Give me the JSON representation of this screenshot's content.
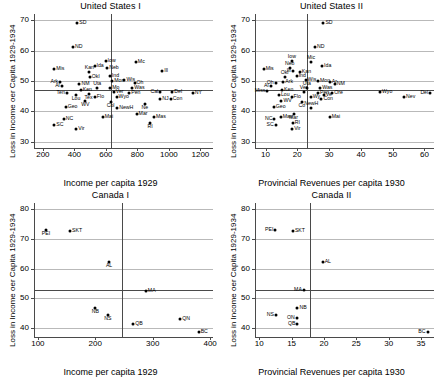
{
  "figure": {
    "width": 442,
    "height": 378
  },
  "chart_data": [
    {
      "type": "scatter",
      "title": "United States I",
      "xlabel": "Income per capita 1929",
      "ylabel": "Loss in Income oer Capita 1929-1934",
      "xlim": [
        150,
        1280
      ],
      "ylim": [
        28,
        72
      ],
      "xticks": [
        200,
        400,
        600,
        800,
        1000,
        1200
      ],
      "yticks": [
        30,
        40,
        50,
        60,
        70
      ],
      "grid": true,
      "vline": 635,
      "hline": 47,
      "points": [
        {
          "label": "SD",
          "x": 418,
          "y": 69.2,
          "pos": "r"
        },
        {
          "label": "ND",
          "x": 392,
          "y": 61.3,
          "pos": "r"
        },
        {
          "label": "Mis",
          "x": 272,
          "y": 53.9,
          "pos": "r"
        },
        {
          "label": "Ark",
          "x": 310,
          "y": 49.6,
          "pos": "l"
        },
        {
          "label": "Al",
          "x": 320,
          "y": 48.3,
          "pos": "l"
        },
        {
          "label": "Ten",
          "x": 352,
          "y": 46.0,
          "pos": "l"
        },
        {
          "label": "Geo",
          "x": 345,
          "y": 41.5,
          "pos": "r"
        },
        {
          "label": "NC",
          "x": 333,
          "y": 37.6,
          "pos": "r"
        },
        {
          "label": "SC",
          "x": 272,
          "y": 35.6,
          "pos": "r"
        },
        {
          "label": "Vir",
          "x": 412,
          "y": 34.4,
          "pos": "r"
        },
        {
          "label": "Kan",
          "x": 495,
          "y": 53.1,
          "pos": "t"
        },
        {
          "label": "Ida",
          "x": 528,
          "y": 54.9,
          "pos": "r"
        },
        {
          "label": "Okl",
          "x": 498,
          "y": 51.3,
          "pos": "r"
        },
        {
          "label": "NM",
          "x": 432,
          "y": 48.9,
          "pos": "r"
        },
        {
          "label": "Ken",
          "x": 440,
          "y": 47.0,
          "pos": "r"
        },
        {
          "label": "Lou",
          "x": 410,
          "y": 45.3,
          "pos": "b"
        },
        {
          "label": "Tex",
          "x": 490,
          "y": 45.8,
          "pos": "b"
        },
        {
          "label": "Uta",
          "x": 545,
          "y": 47.6,
          "pos": "t"
        },
        {
          "label": "Flo",
          "x": 530,
          "y": 44.9,
          "pos": "r"
        },
        {
          "label": "WV",
          "x": 470,
          "y": 43.3,
          "pos": "b"
        },
        {
          "label": "Mai",
          "x": 580,
          "y": 38.2,
          "pos": "r"
        },
        {
          "label": "Iow",
          "x": 598,
          "y": 56.6,
          "pos": "r"
        },
        {
          "label": "Neb",
          "x": 608,
          "y": 54.3,
          "pos": "r"
        },
        {
          "label": "Ind",
          "x": 625,
          "y": 51.6,
          "pos": "r"
        },
        {
          "label": "Mon",
          "x": 640,
          "y": 50.0,
          "pos": "r"
        },
        {
          "label": "Mo",
          "x": 628,
          "y": 47.8,
          "pos": "r"
        },
        {
          "label": "Ver",
          "x": 650,
          "y": 46.4,
          "pos": "r"
        },
        {
          "label": "Wyo",
          "x": 668,
          "y": 44.9,
          "pos": "r"
        },
        {
          "label": "Col",
          "x": 630,
          "y": 43.0,
          "pos": "b"
        },
        {
          "label": "NewH",
          "x": 672,
          "y": 41.2,
          "pos": "r"
        },
        {
          "label": "Mc",
          "x": 790,
          "y": 56.3,
          "pos": "r"
        },
        {
          "label": "Wis",
          "x": 718,
          "y": 50.4,
          "pos": "r"
        },
        {
          "label": "Oh",
          "x": 782,
          "y": 49.2,
          "pos": "r"
        },
        {
          "label": "Was",
          "x": 768,
          "y": 47.6,
          "pos": "r"
        },
        {
          "label": "Pen",
          "x": 748,
          "y": 46.0,
          "pos": "r"
        },
        {
          "label": "Ne",
          "x": 848,
          "y": 42.3,
          "pos": "b"
        },
        {
          "label": "Mar",
          "x": 795,
          "y": 39.1,
          "pos": "r"
        },
        {
          "label": "Mas",
          "x": 905,
          "y": 38.3,
          "pos": "r"
        },
        {
          "label": "RI",
          "x": 880,
          "y": 36.2,
          "pos": "b"
        },
        {
          "label": "Ill",
          "x": 958,
          "y": 53.4,
          "pos": "r"
        },
        {
          "label": "Cal",
          "x": 945,
          "y": 46.3,
          "pos": "l"
        },
        {
          "label": "NJ",
          "x": 945,
          "y": 44.2,
          "pos": "r"
        },
        {
          "label": "Con",
          "x": 1012,
          "y": 44.0,
          "pos": "r"
        },
        {
          "label": "Del",
          "x": 1022,
          "y": 46.5,
          "pos": "r"
        },
        {
          "label": "NY",
          "x": 1152,
          "y": 46.2,
          "pos": "r"
        }
      ]
    },
    {
      "type": "scatter",
      "title": "United States II",
      "xlabel": "Provincial Revenues per capita 1930",
      "ylabel": "Loss in Income oer Capita 1929-1934",
      "xlim": [
        7,
        63
      ],
      "ylim": [
        28,
        72
      ],
      "xticks": [
        10,
        20,
        30,
        40,
        50,
        60
      ],
      "yticks": [
        30,
        40,
        50,
        60,
        70
      ],
      "grid": true,
      "vline": 23,
      "hline": 47,
      "points": [
        {
          "label": "SD",
          "x": 28.2,
          "y": 69.2,
          "pos": "r"
        },
        {
          "label": "ND",
          "x": 25.6,
          "y": 61.3,
          "pos": "r"
        },
        {
          "label": "Iow",
          "x": 18.3,
          "y": 56.6,
          "pos": "t"
        },
        {
          "label": "Mic",
          "x": 24.3,
          "y": 56.3,
          "pos": "t"
        },
        {
          "label": "Ida",
          "x": 27.8,
          "y": 54.9,
          "pos": "r"
        },
        {
          "label": "Neb",
          "x": 17.6,
          "y": 54.3,
          "pos": "t"
        },
        {
          "label": "Mis",
          "x": 9.4,
          "y": 53.9,
          "pos": "r"
        },
        {
          "label": "Ill",
          "x": 18.5,
          "y": 53.4,
          "pos": "l"
        },
        {
          "label": "Kan",
          "x": 20.8,
          "y": 53.1,
          "pos": "r"
        },
        {
          "label": "Okl",
          "x": 16.0,
          "y": 51.3,
          "pos": "t"
        },
        {
          "label": "Ind",
          "x": 19.8,
          "y": 51.6,
          "pos": "r"
        },
        {
          "label": "Oh",
          "x": 13.2,
          "y": 49.2,
          "pos": "l"
        },
        {
          "label": "Wis",
          "x": 22.6,
          "y": 50.4,
          "pos": "r"
        },
        {
          "label": "Mon",
          "x": 26.5,
          "y": 50.0,
          "pos": "r"
        },
        {
          "label": "Ar",
          "x": 30.2,
          "y": 49.6,
          "pos": "r"
        },
        {
          "label": "Ark",
          "x": 15.6,
          "y": 49.6,
          "pos": "r"
        },
        {
          "label": "Al",
          "x": 11.6,
          "y": 48.3,
          "pos": "l"
        },
        {
          "label": "NM",
          "x": 31.8,
          "y": 48.9,
          "pos": "r"
        },
        {
          "label": "Was",
          "x": 27.2,
          "y": 47.6,
          "pos": "r"
        },
        {
          "label": "Uta",
          "x": 23.0,
          "y": 47.6,
          "pos": "t"
        },
        {
          "label": "Pen",
          "x": 26.5,
          "y": 46.0,
          "pos": "r"
        },
        {
          "label": "Ken",
          "x": 15.2,
          "y": 47.0,
          "pos": "r"
        },
        {
          "label": "Miss",
          "x": 10.6,
          "y": 46.7,
          "pos": "l"
        },
        {
          "label": "Ver",
          "x": 22.0,
          "y": 46.4,
          "pos": "t"
        },
        {
          "label": "Ore",
          "x": 31.0,
          "y": 46.2,
          "pos": "r"
        },
        {
          "label": "Ve",
          "x": 28.3,
          "y": 45.3,
          "pos": "r"
        },
        {
          "label": "Wyo",
          "x": 46.0,
          "y": 46.4,
          "pos": "r"
        },
        {
          "label": "Nev",
          "x": 53.6,
          "y": 44.7,
          "pos": "r"
        },
        {
          "label": "Del",
          "x": 61.8,
          "y": 46.2,
          "pos": "l"
        },
        {
          "label": "Lou",
          "x": 14.2,
          "y": 45.3,
          "pos": "r"
        },
        {
          "label": "Flo",
          "x": 18.2,
          "y": 44.9,
          "pos": "r"
        },
        {
          "label": "Wy",
          "x": 24.2,
          "y": 44.9,
          "pos": "r"
        },
        {
          "label": "Con",
          "x": 27.6,
          "y": 44.0,
          "pos": "r"
        },
        {
          "label": "WV",
          "x": 15.0,
          "y": 43.3,
          "pos": "r"
        },
        {
          "label": "Co",
          "x": 21.4,
          "y": 43.0,
          "pos": "b"
        },
        {
          "label": "Geo",
          "x": 12.6,
          "y": 41.5,
          "pos": "r"
        },
        {
          "label": "NewH",
          "x": 24.4,
          "y": 41.2,
          "pos": "t"
        },
        {
          "label": "Mar",
          "x": 18.8,
          "y": 39.1,
          "pos": "b"
        },
        {
          "label": "Mai",
          "x": 30.2,
          "y": 38.2,
          "pos": "r"
        },
        {
          "label": "NC",
          "x": 12.8,
          "y": 37.6,
          "pos": "l"
        },
        {
          "label": "Mas",
          "x": 14.8,
          "y": 38.3,
          "pos": "r"
        },
        {
          "label": "SC",
          "x": 13.2,
          "y": 35.6,
          "pos": "l"
        },
        {
          "label": "RI",
          "x": 18.6,
          "y": 36.2,
          "pos": "r"
        },
        {
          "label": "Vir",
          "x": 18.4,
          "y": 34.4,
          "pos": "r"
        }
      ]
    },
    {
      "type": "scatter",
      "title": "Canada I",
      "xlabel": "Income per capita 1929",
      "ylabel": "Loss in Income oer Capita 1929-1934",
      "xlim": [
        95,
        405
      ],
      "ylim": [
        37,
        82
      ],
      "xticks": [
        100,
        200,
        300,
        400
      ],
      "yticks": [
        40,
        50,
        60,
        70,
        80
      ],
      "grid": true,
      "vline": 247,
      "hline": 52.8,
      "points": [
        {
          "label": "PEI",
          "x": 114,
          "y": 73.0,
          "pos": "b"
        },
        {
          "label": "SKT",
          "x": 156,
          "y": 72.6,
          "pos": "r"
        },
        {
          "label": "AL",
          "x": 224,
          "y": 62.2,
          "pos": "b"
        },
        {
          "label": "MA",
          "x": 288,
          "y": 52.4,
          "pos": "r"
        },
        {
          "label": "NB",
          "x": 200,
          "y": 46.7,
          "pos": "b"
        },
        {
          "label": "NS",
          "x": 222,
          "y": 44.3,
          "pos": "b"
        },
        {
          "label": "QB",
          "x": 266,
          "y": 41.3,
          "pos": "r"
        },
        {
          "label": "QN",
          "x": 348,
          "y": 43.2,
          "pos": "r"
        },
        {
          "label": "BC",
          "x": 380,
          "y": 38.8,
          "pos": "r"
        }
      ]
    },
    {
      "type": "scatter",
      "title": "Canada II",
      "xlabel": "Provincial Revenues per capita 1930",
      "ylabel": "Loss in Income oer Capita 1929-1934",
      "xlim": [
        9.5,
        37
      ],
      "ylim": [
        37,
        82
      ],
      "xticks": [
        10,
        15,
        20,
        25,
        30,
        35
      ],
      "yticks": [
        40,
        50,
        60,
        70,
        80
      ],
      "grid": true,
      "vline": 17.8,
      "hline": 52.8,
      "points": [
        {
          "label": "PEI",
          "x": 12.5,
          "y": 73.0,
          "pos": "l"
        },
        {
          "label": "SKT",
          "x": 15.2,
          "y": 72.6,
          "pos": "r"
        },
        {
          "label": "AL",
          "x": 19.8,
          "y": 62.2,
          "pos": "r"
        },
        {
          "label": "MA",
          "x": 16.9,
          "y": 52.8,
          "pos": "l"
        },
        {
          "label": "NB",
          "x": 15.9,
          "y": 46.7,
          "pos": "r"
        },
        {
          "label": "NS",
          "x": 12.6,
          "y": 44.3,
          "pos": "l"
        },
        {
          "label": "ON",
          "x": 15.8,
          "y": 43.4,
          "pos": "l"
        },
        {
          "label": "QB",
          "x": 15.9,
          "y": 41.3,
          "pos": "l"
        },
        {
          "label": "BC",
          "x": 36.0,
          "y": 38.8,
          "pos": "l"
        }
      ]
    }
  ]
}
